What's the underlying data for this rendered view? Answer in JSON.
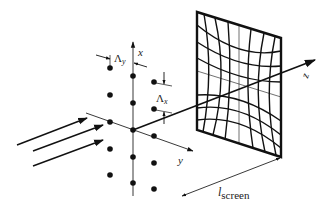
{
  "figure": {
    "colors": {
      "stroke": "#111111",
      "background": "#ffffff"
    }
  },
  "labels": {
    "axis_x": "x",
    "axis_y": "y",
    "axis_z": "z",
    "lambda_y": "Λ",
    "lambda_y_sub": "y",
    "lambda_x": "Λ",
    "lambda_x_sub": "x",
    "screen_distance": "l",
    "screen_distance_sub": "screen"
  },
  "lattice": {
    "columns": 3,
    "rows": 5,
    "dots": [
      [
        110,
        68
      ],
      [
        110,
        95
      ],
      [
        110,
        122
      ],
      [
        110,
        149
      ],
      [
        110,
        175
      ],
      [
        133,
        76
      ],
      [
        133,
        103
      ],
      [
        133,
        130
      ],
      [
        133,
        157
      ],
      [
        133,
        183
      ],
      [
        154,
        82
      ],
      [
        154,
        109
      ],
      [
        154,
        136
      ],
      [
        154,
        163
      ],
      [
        154,
        189
      ]
    ]
  },
  "incoming_beams": [
    {
      "from": [
        17,
        145
      ],
      "to": [
        87,
        118
      ]
    },
    {
      "from": [
        33,
        151
      ],
      "to": [
        103,
        125
      ]
    },
    {
      "from": [
        33,
        166
      ],
      "to": [
        103,
        140
      ]
    }
  ],
  "screen": {
    "corners": [
      [
        197,
        12
      ],
      [
        281,
        38
      ],
      [
        281,
        157
      ],
      [
        197,
        130
      ]
    ]
  }
}
